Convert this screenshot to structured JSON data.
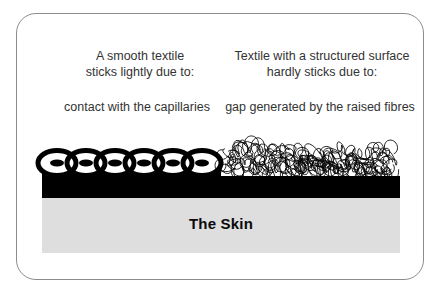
{
  "columns": {
    "left": {
      "heading": "A smooth textile\nsticks lightly due to:",
      "cause": "contact with the capillaries"
    },
    "right": {
      "heading": "Textile with a structured surface\nhardly sticks due to:",
      "cause": "gap generated by the raised fibres"
    }
  },
  "diagram": {
    "skin_label": "The Skin",
    "icons": {
      "smooth_textile": "chain-loops-graphic",
      "structured_textile": "tangled-fibres-graphic"
    }
  },
  "colors": {
    "ink": "#000000",
    "skin": "#dedede",
    "text": "#333333",
    "border": "#8c8c8c",
    "background": "#ffffff"
  }
}
